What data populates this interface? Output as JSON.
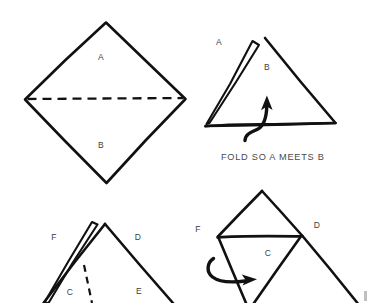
{
  "document": {
    "kind": "paper-folding-instruction-diagram",
    "background_color": "#ffffff",
    "ink_color": "#111111",
    "label_color": "#3d3d3d",
    "width": 368,
    "height": 303
  },
  "panels": [
    {
      "id": "panel-1",
      "name": "flat-diamond-with-foldline",
      "shape": "diamond",
      "labels": [
        {
          "text": "A",
          "x": 101,
          "y": 60
        },
        {
          "text": "B",
          "x": 101,
          "y": 148
        }
      ],
      "fold_line": "horizontal-dashed"
    },
    {
      "id": "panel-2",
      "name": "folded-triangle-with-up-arrow",
      "shape": "triangle",
      "labels": [
        {
          "text": "A",
          "x": 219,
          "y": 45
        },
        {
          "text": "B",
          "x": 267,
          "y": 70
        }
      ],
      "arrow": "curved-up-arrow",
      "caption": "FOLD SO A MEETS B"
    },
    {
      "id": "panel-3",
      "name": "folded-peak-with-dashed-foldline",
      "shape": "peak",
      "labels": [
        {
          "text": "F",
          "x": 54,
          "y": 240
        },
        {
          "text": "D",
          "x": 138,
          "y": 240
        },
        {
          "text": "C",
          "x": 70,
          "y": 295
        },
        {
          "text": "E",
          "x": 139,
          "y": 294
        }
      ],
      "fold_line": "diagonal-dashed"
    },
    {
      "id": "panel-4",
      "name": "kite-with-inner-triangle-and-right-arrow",
      "shape": "kite",
      "labels": [
        {
          "text": "F",
          "x": 198,
          "y": 232
        },
        {
          "text": "D",
          "x": 317,
          "y": 228
        },
        {
          "text": "C",
          "x": 268,
          "y": 256
        }
      ],
      "arrow": "curved-right-arrow"
    }
  ],
  "captions": {
    "fold_a_meets_b": "FOLD SO A MEETS B"
  },
  "icons": {
    "up_arrow": "curved-arrow-up-icon",
    "right_arrow": "curved-arrow-right-icon"
  }
}
